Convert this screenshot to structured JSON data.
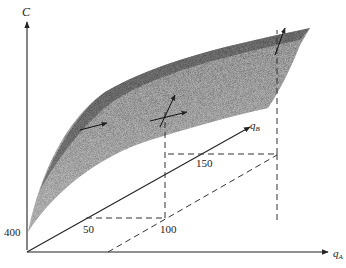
{
  "figure": {
    "type": "3d-cost-surface",
    "axes": {
      "vertical": {
        "label": "C"
      },
      "x": {
        "label": "q",
        "subscript": "A"
      },
      "depth": {
        "label": "q",
        "subscript": "B"
      }
    },
    "tick_labels": {
      "c_intercept": "400",
      "qA_mark": "100",
      "qB_mark_1": "50",
      "qB_mark_2": "150"
    },
    "colors": {
      "surface_dark": "#2a2a2a",
      "surface_mid": "#6a6a6a",
      "axis": "#222222",
      "background": "#ffffff"
    }
  }
}
